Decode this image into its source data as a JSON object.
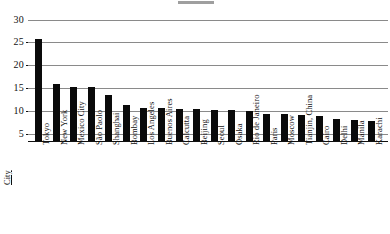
{
  "chart_data": {
    "type": "bar",
    "title": "",
    "xlabel": "City",
    "ylabel": "",
    "ylim": [
      3.5,
      31
    ],
    "grid": true,
    "legend": "none",
    "yticks": [
      5,
      10,
      15,
      20,
      25,
      30
    ],
    "categories": [
      "Tokyo",
      "New York",
      "Mexico City",
      "São Paolo",
      "Shanghai",
      "Bombay",
      "Los Angeles",
      "Buenos Aires",
      "Calcutta",
      "Beijing",
      "Seoul",
      "Osaka",
      "Rio de Janeiro",
      "Paris",
      "Moscow",
      "Tianjin, China",
      "Cairo",
      "Delhi",
      "Manila",
      "Karachi"
    ],
    "values": [
      25.8,
      16.0,
      15.3,
      15.2,
      13.6,
      11.4,
      10.6,
      10.6,
      10.5,
      10.4,
      10.3,
      10.2,
      10.1,
      9.4,
      9.3,
      9.2,
      8.9,
      8.4,
      8.0,
      7.8
    ]
  },
  "axis": {
    "x_title": "City"
  }
}
